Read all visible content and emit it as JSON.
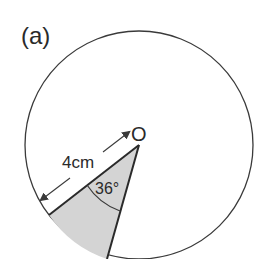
{
  "figure": {
    "part_label": "(a)",
    "center_label": "O",
    "radius_label": "4cm",
    "angle_label": "36°",
    "colors": {
      "stroke": "#3a3a3a",
      "sector_fill": "#d4d4d4",
      "background": "#ffffff"
    }
  },
  "diagram_data": {
    "shape": "circle",
    "radius_cm": 4,
    "sector_angle_deg": 36,
    "sector_shaded": true
  }
}
